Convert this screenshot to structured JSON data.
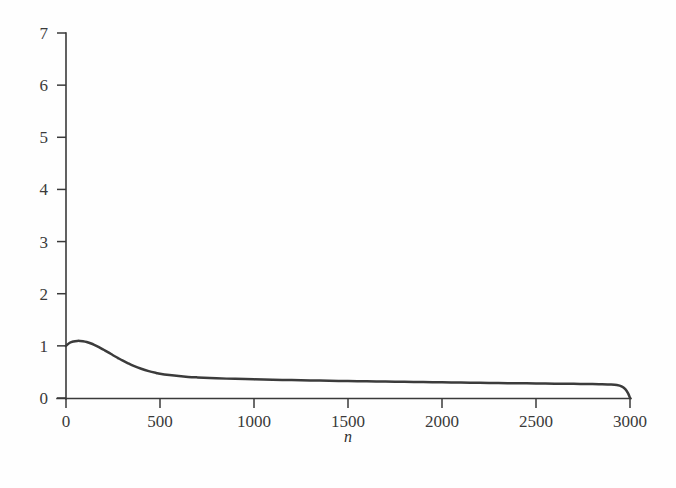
{
  "figure": {
    "background_color": "#fefefe",
    "curve_color": "#3b3b3b",
    "axis_color": "#3a3a3a"
  },
  "chart_data": {
    "type": "line",
    "title": "",
    "subtitle": "",
    "xlabel": "n",
    "ylabel": "",
    "xlim": [
      0,
      3000
    ],
    "ylim": [
      0,
      7
    ],
    "grid": false,
    "legend": null,
    "legend_position": "none",
    "x_ticks": [
      0,
      500,
      1000,
      1500,
      2000,
      2500,
      3000
    ],
    "x_tick_labels": [
      "0",
      "500",
      "1000",
      "1500",
      "2000",
      "2500",
      "3000"
    ],
    "y_ticks": [
      0,
      1,
      2,
      3,
      4,
      5,
      6,
      7
    ],
    "y_tick_labels": [
      "0",
      "1",
      "2",
      "3",
      "4",
      "5",
      "6",
      "7"
    ],
    "series": [
      {
        "name": "curve",
        "x": [
          0,
          20,
          40,
          60,
          75,
          90,
          110,
          130,
          150,
          175,
          200,
          225,
          250,
          275,
          300,
          330,
          360,
          400,
          440,
          480,
          500,
          550,
          600,
          650,
          700,
          800,
          900,
          1000,
          1100,
          1200,
          1300,
          1400,
          1500,
          1600,
          1700,
          1800,
          1900,
          2000,
          2100,
          2200,
          2300,
          2400,
          2500,
          2600,
          2700,
          2800,
          2850,
          2900,
          2930,
          2955,
          2975,
          2990,
          3000
        ],
        "y": [
          1.0,
          1.06,
          1.085,
          1.095,
          1.095,
          1.09,
          1.075,
          1.05,
          1.02,
          0.975,
          0.925,
          0.875,
          0.82,
          0.77,
          0.72,
          0.665,
          0.615,
          0.56,
          0.515,
          0.48,
          0.465,
          0.44,
          0.42,
          0.405,
          0.395,
          0.378,
          0.367,
          0.358,
          0.35,
          0.343,
          0.337,
          0.331,
          0.325,
          0.32,
          0.315,
          0.31,
          0.305,
          0.3,
          0.295,
          0.291,
          0.287,
          0.283,
          0.279,
          0.275,
          0.271,
          0.267,
          0.265,
          0.26,
          0.25,
          0.225,
          0.17,
          0.09,
          0.0
        ]
      }
    ],
    "annotations": [],
    "peak": {
      "x": 75,
      "y": 1.095
    },
    "start_value": 1.0,
    "end_value": 0.0
  }
}
